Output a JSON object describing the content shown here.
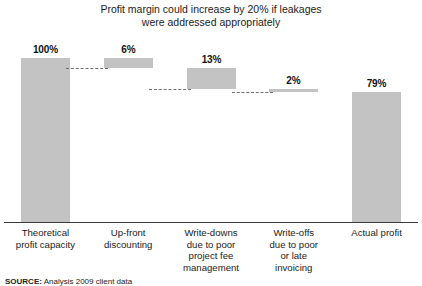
{
  "chart_data": {
    "type": "bar",
    "subtype": "waterfall",
    "title": "Profit margin could increase by 20% if leakages\nwere addressed appropriately",
    "xlabel": "",
    "ylabel": "",
    "ylim": [
      0,
      100
    ],
    "grid": false,
    "legend": null,
    "units": "percent",
    "categories": [
      "Theoretical\nprofit capacity",
      "Up-front\ndiscounting",
      "Write-downs\ndue to poor\nproject fee\nmanagement",
      "Write-offs\ndue to poor\nor late\ninvoicing",
      "Actual profit"
    ],
    "values": [
      100,
      6,
      13,
      2,
      79
    ],
    "data_labels": [
      "100%",
      "6%",
      "13%",
      "2%",
      "79%"
    ],
    "steps": [
      {
        "label": "Theoretical profit capacity",
        "value": 100,
        "kind": "total",
        "start": 0,
        "end": 100
      },
      {
        "label": "Up-front discounting",
        "value": 6,
        "kind": "decrease",
        "start": 94,
        "end": 100
      },
      {
        "label": "Write-downs due to poor project fee management",
        "value": 13,
        "kind": "decrease",
        "start": 81,
        "end": 94
      },
      {
        "label": "Write-offs due to poor or late invoicing",
        "value": 2,
        "kind": "decrease",
        "start": 79,
        "end": 81
      },
      {
        "label": "Actual profit",
        "value": 79,
        "kind": "total",
        "start": 0,
        "end": 79
      }
    ],
    "colors": {
      "bar_fill": "#c3c3c3",
      "connector": "#6f6f6f",
      "axis": "#3a3a3a",
      "text": "#1b1b1b"
    }
  },
  "source": {
    "prefix": "SOURCE:",
    "text": "Analysis 2009 client data"
  }
}
